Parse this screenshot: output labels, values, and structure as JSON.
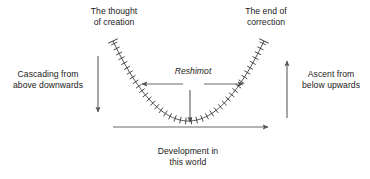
{
  "diagram": {
    "title_cut_off": "",
    "labels": {
      "thought_of_creation": {
        "line1": "The thought",
        "line2": "of creation"
      },
      "end_of_correction": {
        "line1": "The end of",
        "line2": "correction"
      },
      "cascading": {
        "line1": "Cascading from",
        "line2": "above downwards"
      },
      "ascent": {
        "line1": "Ascent from",
        "line2": "below upwards"
      },
      "reshimot": "Reshimot",
      "development": {
        "line1": "Development in",
        "line2": "this world"
      }
    },
    "colors": {
      "stroke": "#555555",
      "curve": "#3a3a3a",
      "text": "#1a1a1a",
      "background": "#ffffff"
    },
    "icons": {
      "arrow_down_left": "down-arrow",
      "arrow_up_right": "up-arrow",
      "arrow_left_reshimot": "left-arrow",
      "arrow_right_reshimot": "right-arrow",
      "arrow_down_center": "down-arrow",
      "axis_arrow_right": "right-arrow"
    }
  },
  "chart_data": {
    "type": "line",
    "title": "",
    "xlabel": "Development in this world",
    "ylabel": "",
    "grid": false,
    "legend": null,
    "annotations": [
      "The thought of creation",
      "The end of correction",
      "Cascading from above downwards",
      "Ascent from below upwards",
      "Reshimot",
      "Development in this world"
    ],
    "series": [
      {
        "name": "Reshimot parabola",
        "comment": "symmetric U-shaped curve with perpendicular tick marks (reshimot) distributed along its arc",
        "x": [
          113,
          117,
          122,
          128,
          134,
          141,
          149,
          158,
          168,
          179,
          190,
          201,
          212,
          222,
          231,
          239,
          246,
          252,
          257,
          261,
          264
        ],
        "y": [
          41,
          51,
          61,
          71,
          81,
          90,
          98,
          106,
          113,
          118,
          121,
          118,
          113,
          106,
          98,
          90,
          81,
          71,
          61,
          51,
          41
        ]
      }
    ],
    "axis_line": {
      "x_start": 113,
      "x_end": 272,
      "y": 127,
      "arrow": "right"
    },
    "tick_count": 42
  }
}
